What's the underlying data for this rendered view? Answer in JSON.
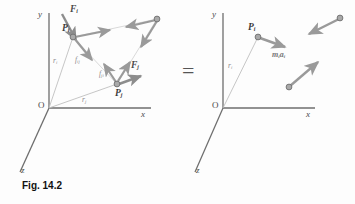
{
  "figure": {
    "caption": "Fig. 14.2",
    "equals_sign": "=",
    "colors": {
      "axis": "#6e6e6e",
      "force_arrow": "#8d8d8d",
      "internal_arrow": "#9a9a9a",
      "position_line": "#b9b9b9",
      "particle_fill": "#a9a9a9",
      "particle_stroke": "#6f6f6f",
      "text": "#3b3b3b",
      "faint_text": "#8a8a8a"
    }
  },
  "left_diagram": {
    "axes": {
      "y_label": "y",
      "x_label": "x",
      "z_label": "z",
      "origin_label": "O"
    },
    "points": [
      {
        "name": "point-i",
        "label": "P",
        "sub": "i"
      },
      {
        "name": "point-j",
        "label": "P",
        "sub": "j"
      },
      {
        "name": "point-k",
        "label": "",
        "sub": ""
      }
    ],
    "vectors": [
      {
        "name": "external-force-i",
        "label": "F",
        "sub": "i"
      },
      {
        "name": "external-force-j",
        "label": "F",
        "sub": "j"
      },
      {
        "name": "position-vector-i",
        "label": "r",
        "sub": "i"
      },
      {
        "name": "position-vector-j",
        "label": "r",
        "sub": "j"
      },
      {
        "name": "internal-force-ij",
        "label": "f",
        "sub": "ij"
      },
      {
        "name": "internal-force-ji",
        "label": "f",
        "sub": "ji"
      }
    ]
  },
  "right_diagram": {
    "axes": {
      "y_label": "y",
      "x_label": "x",
      "z_label": "z",
      "origin_label": "O"
    },
    "points": [
      {
        "name": "point-i",
        "label": "P",
        "sub": "i"
      }
    ],
    "vectors": [
      {
        "name": "position-vector-i",
        "label": "r",
        "sub": "i"
      },
      {
        "name": "effective-force-i",
        "label": "m",
        "sub": "i",
        "label2": "a",
        "sub2": "i"
      }
    ]
  }
}
